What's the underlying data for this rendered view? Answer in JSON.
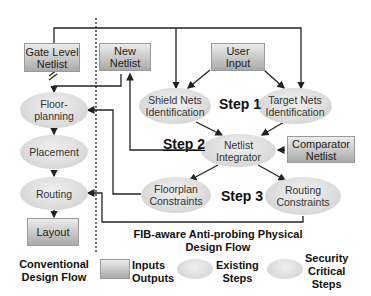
{
  "conventional_flow": {
    "nodes": {
      "gate_level_netlist": "Gate Level\nNetlist",
      "floorplanning": "Floor-\nplanning",
      "placement": "Placement",
      "routing": "Routing",
      "layout": "Layout"
    },
    "caption": "Conventional\nDesign Flow"
  },
  "fib_flow": {
    "nodes": {
      "new_netlist": "New\nNetlist",
      "user_input": "User\nInput",
      "shield_nets": "Shield Nets\nIdentification",
      "target_nets": "Target Nets\nIdentification",
      "netlist_integrator": "Netlist\nIntegrator",
      "comparator_netlist": "Comparator\nNetlist",
      "floorplan_constraints": "Floorplan\nConstraints",
      "routing_constraints": "Routing\nConstraints"
    },
    "steps": {
      "step1": "Step 1",
      "step2": "Step 2",
      "step3": "Step 3"
    },
    "caption": "FIB-aware Anti-probing Physical\nDesign Flow"
  },
  "legend": {
    "inputs_outputs": "Inputs\nOutputs",
    "existing_steps": "Existing\nSteps",
    "security_critical_steps": "Security\nCritical\nSteps"
  },
  "colors": {
    "box_top": "#ececec",
    "box_bottom": "#a9a9a9",
    "ellipse": "#dcdcdc",
    "line": "#222222"
  }
}
